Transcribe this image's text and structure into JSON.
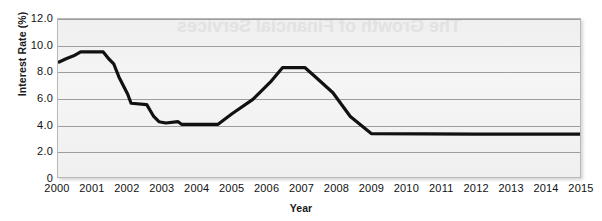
{
  "chart_data": {
    "type": "line",
    "title": "",
    "xlabel": "Year",
    "ylabel": "Interest Rate (%)",
    "xlim": [
      2000,
      2015
    ],
    "ylim": [
      0,
      12
    ],
    "grid": true,
    "legend": null,
    "yticks": [
      "0",
      "2.0",
      "4.0",
      "6.0",
      "8.0",
      "10.0",
      "12.0"
    ],
    "ytick_values": [
      0,
      2,
      4,
      6,
      8,
      10,
      12
    ],
    "xticks": [
      "2000",
      "2001",
      "2002",
      "2003",
      "2004",
      "2005",
      "2006",
      "2007",
      "2008",
      "2009",
      "2010",
      "2011",
      "2012",
      "2013",
      "2014",
      "2015"
    ],
    "series": [
      {
        "name": "Interest Rate",
        "color": "#111111",
        "x": [
          2000.0,
          2000.25,
          2000.45,
          2000.65,
          2000.85,
          2001.3,
          2001.45,
          2001.6,
          2001.75,
          2002.0,
          2002.1,
          2002.55,
          2002.75,
          2002.9,
          2003.1,
          2003.45,
          2003.55,
          2004.6,
          2005.0,
          2005.6,
          2006.1,
          2006.45,
          2007.1,
          2007.4,
          2007.9,
          2008.4,
          2009.0,
          2012.0,
          2015.0
        ],
        "y": [
          8.7,
          9.0,
          9.2,
          9.5,
          9.5,
          9.5,
          9.0,
          8.6,
          7.6,
          6.3,
          5.6,
          5.5,
          4.6,
          4.2,
          4.1,
          4.2,
          4.0,
          4.0,
          4.8,
          5.9,
          7.2,
          8.3,
          8.3,
          7.6,
          6.4,
          4.6,
          3.3,
          3.25,
          3.25
        ]
      }
    ],
    "annotations": [
      {
        "name": "bleed-through-title",
        "text": "The Growth of Financial Services"
      }
    ]
  },
  "axes": {
    "y_title": "Interest Rate (%)",
    "x_title": "Year"
  },
  "style": {
    "line_color": "#111111",
    "grid_color": "#9d9d9d",
    "plot_bg": "#f2f2f2",
    "frame_color": "#b9b9b9"
  }
}
